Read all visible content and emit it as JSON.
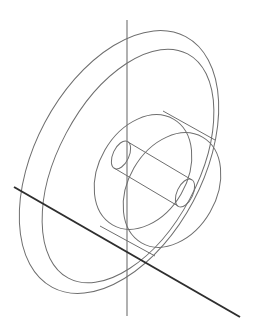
{
  "drawing": {
    "type": "3D wireframe",
    "subject": "wheel with hub and shaft (isometric view)",
    "colors": {
      "background": "#ffffff",
      "wireframe": "#6e6e6e",
      "vertical_axis": "#707070",
      "diagonal_axis": "#2e2e2e"
    },
    "vertical_axis": {
      "x1": 127,
      "y1": 20,
      "x2": 127,
      "y2": 316
    },
    "diagonal_axis": {
      "x1": 14,
      "y1": 187,
      "x2": 240,
      "y2": 317
    },
    "rim_front": {
      "cx": 119,
      "cy": 162,
      "rx": 84,
      "ry": 142,
      "rotate": 28
    },
    "rim_back": {
      "cx": 128,
      "cy": 166,
      "rx": 70,
      "ry": 127,
      "rotate": 28
    },
    "hub_front": {
      "cx": 143,
      "cy": 172,
      "rx": 44,
      "ry": 61,
      "rotate": 30
    },
    "hub_back": {
      "cx": 172,
      "cy": 190,
      "rx": 44,
      "ry": 61,
      "rotate": 30
    },
    "shaft_left": {
      "cx": 121,
      "cy": 155,
      "rx": 8,
      "ry": 15,
      "rotate": 25
    },
    "shaft_right": {
      "cx": 185,
      "cy": 193,
      "rx": 8,
      "ry": 15,
      "rotate": 25
    }
  }
}
